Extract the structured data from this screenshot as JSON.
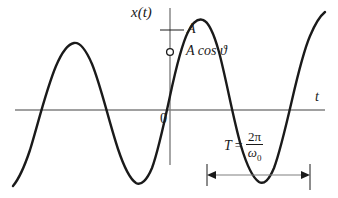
{
  "figure": {
    "name": "sinusoidal-signal-plot",
    "background_color": "#ffffff",
    "curve_color": "#1a1a1a",
    "axis_color": "#808080",
    "marker_fill": "#ffffff"
  },
  "labels": {
    "vertical_axis": "x(t)",
    "horizontal_axis": "t",
    "origin": "0",
    "amplitude": "A",
    "initial_value": "A cos ϑ",
    "period_symbol": "T",
    "period_equals": "=",
    "period_numerator": "2π",
    "period_denominator_base": "ω",
    "period_denominator_sub": "0"
  },
  "chart_data": {
    "type": "line",
    "title": "",
    "xlabel": "t",
    "ylabel": "x(t)",
    "function": "x(t) = A cos(ω₀t + ϑ)",
    "amplitude": 1,
    "period_px": 120,
    "phase_note": "peak occurs slightly before t = 0; value at t = 0 is A cos ϑ",
    "grid": false,
    "legend": null,
    "xlim": [
      -155,
      168
    ],
    "ylim": [
      -1.25,
      1.25
    ],
    "axes": {
      "x_axis_y_px": 110,
      "x_axis_from_px": 15,
      "x_axis_to_px": 325,
      "y_axis_x_px": 170,
      "y_axis_from_px": 8,
      "y_axis_to_px": 165
    },
    "markers": [
      {
        "name": "initial-value-marker",
        "shape": "open-circle",
        "x_px": 170,
        "y_px": 52,
        "label": "A cos ϑ"
      }
    ],
    "annotations": [
      {
        "name": "amplitude-tick",
        "type": "tick",
        "from_px": [
          160,
          30
        ],
        "to_px": [
          184,
          30
        ],
        "label": "A"
      },
      {
        "name": "period-arrow",
        "type": "double-arrow",
        "from_px": [
          207,
          175
        ],
        "to_px": [
          310,
          175
        ],
        "label": "T = 2π/ω₀"
      }
    ],
    "series": [
      {
        "name": "x(t)",
        "path_px": "M 13,186 C 18,180 24,168 30,150 C 38,124 46,90 56,66 C 62,52 68,44 74,43 C 80,42 86,50 92,64 C 101,86 109,122 118,149 C 124,167 130,179 136,183 C 141,186 147,180 152,168 C 158,152 164,124 170,96 C 176,68 182,44 188,32 C 193,22 198,18 203,20 C 209,22 214,34 219,52 C 226,78 233,118 241,146 C 247,166 253,178 259,182 C 264,185 269,180 274,168 C 280,152 286,126 292,100 C 298,74 304,50 310,36 C 315,24 320,16 325,12"
      }
    ]
  }
}
